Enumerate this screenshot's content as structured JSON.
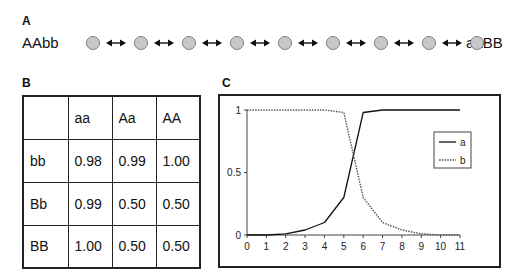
{
  "panels": {
    "a": {
      "label": "A",
      "left_genotype": "AAbb",
      "right_genotype": "aaBB",
      "node_count": 9,
      "connector_icon": "double-arrow"
    },
    "b": {
      "label": "B",
      "table": {
        "columns": [
          "",
          "aa",
          "Aa",
          "AA"
        ],
        "rows": [
          {
            "header": "bb",
            "values": [
              "0.98",
              "0.99",
              "1.00"
            ]
          },
          {
            "header": "Bb",
            "values": [
              "0.99",
              "0.50",
              "0.50"
            ]
          },
          {
            "header": "BB",
            "values": [
              "1.00",
              "0.50",
              "0.50"
            ]
          }
        ]
      }
    },
    "c": {
      "label": "C"
    }
  },
  "chart_data": {
    "type": "line",
    "title": "",
    "xlabel": "",
    "ylabel": "",
    "x": [
      0,
      1,
      2,
      3,
      4,
      5,
      6,
      7,
      8,
      9,
      10,
      11
    ],
    "series": [
      {
        "name": "a",
        "style": "solid",
        "values": [
          0,
          0,
          0.01,
          0.04,
          0.1,
          0.3,
          0.98,
          1,
          1,
          1,
          1,
          1
        ]
      },
      {
        "name": "b",
        "style": "dotted",
        "values": [
          1,
          1,
          1,
          1,
          1,
          0.98,
          0.3,
          0.1,
          0.04,
          0.01,
          0,
          0
        ]
      }
    ],
    "xticks": [
      "0",
      "1",
      "2",
      "3",
      "4",
      "5",
      "6",
      "7",
      "8",
      "9",
      "10",
      "11"
    ],
    "yticks": [
      "0",
      "0.5",
      "1"
    ],
    "xlim": [
      0,
      11
    ],
    "ylim": [
      0,
      1
    ],
    "grid": false,
    "legend": {
      "position": "right",
      "entries": [
        "a",
        "b"
      ]
    }
  }
}
